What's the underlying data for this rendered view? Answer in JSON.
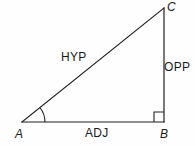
{
  "figure": {
    "stroke_color": "#1f1f1f",
    "background_color": "#fefefe",
    "stroke_width": 1.2,
    "vertices": [
      {
        "name": "A",
        "label": "A",
        "x": 22,
        "y": 122
      },
      {
        "name": "B",
        "label": "B",
        "x": 164,
        "y": 122
      },
      {
        "name": "C",
        "label": "C",
        "x": 164,
        "y": 8
      }
    ],
    "sides": [
      {
        "name": "hypotenuse",
        "label": "HYP",
        "from": "A",
        "to": "C"
      },
      {
        "name": "opposite",
        "label": "OPP",
        "from": "B",
        "to": "C"
      },
      {
        "name": "adjacent",
        "label": "ADJ",
        "from": "A",
        "to": "B"
      }
    ],
    "angles": [
      {
        "name": "theta-at-A",
        "at": "A",
        "marker": "arc",
        "radius": 23
      },
      {
        "name": "right-angle-at-B",
        "at": "B",
        "marker": "square",
        "size": 10,
        "degrees": 90
      }
    ]
  }
}
